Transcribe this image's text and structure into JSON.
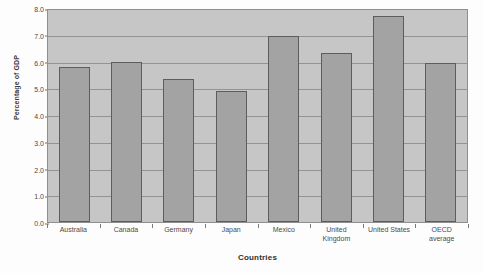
{
  "chart_data": {
    "type": "bar",
    "title": "",
    "xlabel": "Countries",
    "ylabel": "Percentage of GDP",
    "categories": [
      "Australia",
      "Canada",
      "Germany",
      "Japan",
      "Mexico",
      "United Kingdom",
      "United States",
      "OECD average"
    ],
    "category_lines": [
      [
        "Australia"
      ],
      [
        "Canada"
      ],
      [
        "Germany"
      ],
      [
        "Japan"
      ],
      [
        "Mexico"
      ],
      [
        "United",
        "Kingdom"
      ],
      [
        "United States"
      ],
      [
        "OECD",
        "average"
      ]
    ],
    "values": [
      5.8,
      6.0,
      5.35,
      4.9,
      6.95,
      6.3,
      7.7,
      5.95
    ],
    "ylim": [
      0.0,
      8.0
    ],
    "ytick_values": [
      0.0,
      1.0,
      2.0,
      3.0,
      4.0,
      5.0,
      6.0,
      7.0,
      8.0
    ],
    "ytick_labels": [
      "0.0",
      "1.0",
      "2.0",
      "3.0",
      "4.0",
      "5.0",
      "6.0",
      "7.0",
      "8.0"
    ],
    "grid": true,
    "legend": "none",
    "colors": {
      "bar_fill": "#a3a3a3",
      "bar_edge": "#5d5d5d",
      "plot_background": "#c6c6c6",
      "gridline": "#8a8a8a",
      "axis_text": "#4a4a4a",
      "page_background": "#fdfdfd"
    }
  }
}
